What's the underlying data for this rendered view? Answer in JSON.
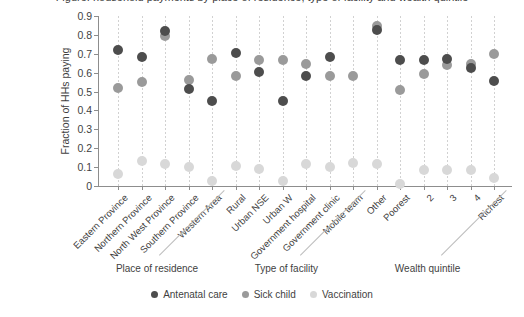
{
  "title_sliver": "Figure: household payments by place of residence, type of facility and wealth quintile",
  "axis": {
    "y_title": "Fraction of HHs paying",
    "y_ticks": [
      "0.9",
      "0.8",
      "0.7",
      "0.6",
      "0.5",
      "0.4",
      "0.3",
      "0.2",
      "0.1",
      "0"
    ]
  },
  "group_labels": [
    {
      "label": "Place of residence"
    },
    {
      "label": "Type of facility"
    },
    {
      "label": "Wealth quintile"
    }
  ],
  "legend": {
    "items": [
      {
        "label": "Antenatal care",
        "color": "#4d4d4d"
      },
      {
        "label": "Sick child",
        "color": "#9a9a9a"
      },
      {
        "label": "Vaccination",
        "color": "#d8d8d8"
      }
    ]
  },
  "chart_data": {
    "type": "scatter",
    "title": "",
    "xlabel": "",
    "ylabel": "Fraction of HHs paying",
    "ylim": [
      0,
      0.9
    ],
    "ytick_values": [
      0,
      0.1,
      0.2,
      0.3,
      0.4,
      0.5,
      0.6,
      0.7,
      0.8,
      0.9
    ],
    "grid": "vertical dotted guide line per category",
    "legend_position": "bottom-center",
    "groups": [
      {
        "name": "Place of residence",
        "categories": [
          "Eastern Province",
          "Northern Province",
          "North West Province",
          "Southern Province",
          "Western Area"
        ]
      },
      {
        "name": "Type of facility",
        "categories": [
          "Rural",
          "Urban NSE",
          "Urban W",
          "Government hospital",
          "Government clinic",
          "Mobile team"
        ]
      },
      {
        "name": "Wealth quintile",
        "categories": [
          "Other",
          "Poorest",
          "2",
          "3",
          "4",
          "Richest"
        ]
      }
    ],
    "categories": [
      "Eastern Province",
      "Northern Province",
      "North West Province",
      "Southern Province",
      "Western Area",
      "Rural",
      "Urban NSE",
      "Urban W",
      "Government hospital",
      "Government clinic",
      "Mobile team",
      "Other",
      "Poorest",
      "2",
      "3",
      "4",
      "Richest"
    ],
    "series": [
      {
        "name": "Antenatal care",
        "color": "#4d4d4d",
        "values": [
          0.72,
          0.685,
          0.82,
          0.515,
          0.45,
          0.705,
          0.605,
          0.45,
          0.585,
          0.685,
          null,
          0.825,
          0.665,
          0.665,
          0.675,
          0.625,
          0.555
        ]
      },
      {
        "name": "Sick child",
        "color": "#9a9a9a",
        "values": [
          0.52,
          0.55,
          0.795,
          0.56,
          0.675,
          0.58,
          0.665,
          0.665,
          0.645,
          0.585,
          0.585,
          0.845,
          0.51,
          0.595,
          0.64,
          0.645,
          0.7
        ]
      },
      {
        "name": "Vaccination",
        "color": "#d8d8d8",
        "values": [
          0.065,
          0.135,
          0.115,
          0.1,
          0.025,
          0.105,
          0.09,
          0.025,
          0.115,
          0.1,
          0.12,
          0.115,
          0.01,
          0.085,
          0.085,
          0.085,
          0.045
        ]
      }
    ]
  }
}
